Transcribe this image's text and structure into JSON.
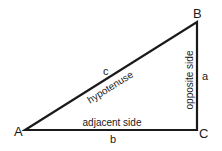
{
  "diagram": {
    "vertices": [
      {
        "id": "A",
        "label": "A"
      },
      {
        "id": "B",
        "label": "B"
      },
      {
        "id": "C",
        "label": "C"
      }
    ],
    "sides": {
      "hypotenuse": {
        "letter": "c",
        "name": "hypotenuse"
      },
      "adjacent": {
        "letter": "b",
        "name": "adjacent side"
      },
      "opposite": {
        "letter": "a",
        "name": "opposite side"
      }
    },
    "colors": {
      "stroke": "#1a1a1a",
      "background": "#ffffff"
    }
  }
}
